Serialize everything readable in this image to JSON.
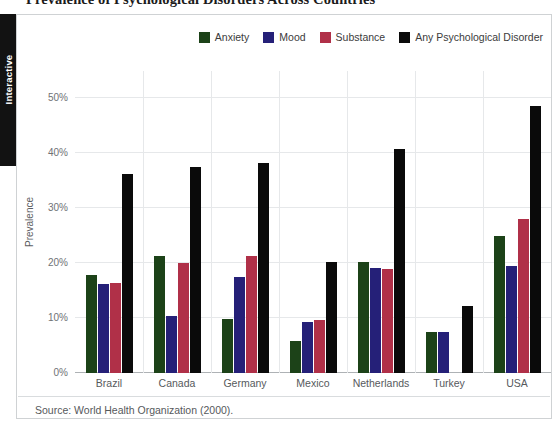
{
  "page_title": "Prevalence of Psychological Disorders Across Countries",
  "rail": {
    "label": "Interactive"
  },
  "source": {
    "text": "Source: World Health Organization (2000)."
  },
  "colors": {
    "anxiety": "#1c4218",
    "mood": "#252078",
    "substance": "#b03048",
    "any": "#0a0a0a",
    "grid": "#e6e8ea",
    "axis": "#aeb2b5",
    "tick_text": "#6f7275",
    "card_border": "#cfd2d4",
    "rail_bg": "#121212"
  },
  "chart_data": {
    "type": "bar",
    "title": "Prevalence of Psychological Disorders Across Countries",
    "xlabel": "",
    "ylabel": "Prevalence",
    "ylim": [
      0,
      55
    ],
    "ytick_values": [
      0,
      10,
      20,
      30,
      40,
      50
    ],
    "ytick_labels": [
      "0%",
      "10%",
      "20%",
      "30%",
      "40%",
      "50%"
    ],
    "grid": true,
    "legend_position": "top-right",
    "categories": [
      "Brazil",
      "Canada",
      "Germany",
      "Mexico",
      "Netherlands",
      "Turkey",
      "USA"
    ],
    "series": [
      {
        "name": "Anxiety",
        "color": "#1c4218",
        "values": [
          17.8,
          21.3,
          9.9,
          5.8,
          20.3,
          7.4,
          24.9
        ]
      },
      {
        "name": "Mood",
        "color": "#252078",
        "values": [
          16.2,
          10.3,
          17.4,
          9.2,
          19.2,
          7.4,
          19.5
        ]
      },
      {
        "name": "Substance",
        "color": "#b03048",
        "values": [
          16.4,
          20.0,
          21.4,
          9.7,
          18.9,
          null,
          28.0
        ]
      },
      {
        "name": "Any Psychological Disorder",
        "color": "#0a0a0a",
        "values": [
          36.2,
          37.5,
          38.2,
          20.3,
          40.8,
          12.2,
          48.6
        ]
      }
    ]
  }
}
